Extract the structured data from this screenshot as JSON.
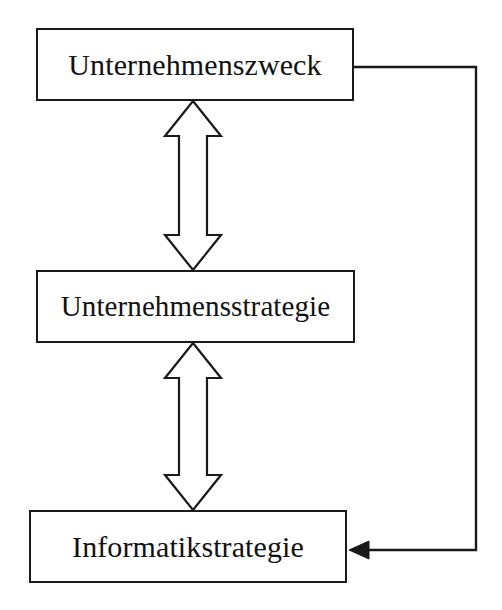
{
  "diagram": {
    "type": "flow-diagram",
    "background_color": "#ffffff",
    "stroke_color": "#1a1a1a",
    "fill_color": "#ffffff",
    "nodes": [
      {
        "id": "unternehmenszweck",
        "label": "Unternehmenszweck",
        "x": 36,
        "y": 28,
        "width": 318,
        "height": 73
      },
      {
        "id": "unternehmensstrategie",
        "label": "Unternehmensstrategie",
        "x": 36,
        "y": 270,
        "width": 319,
        "height": 73
      },
      {
        "id": "informatikstrategie",
        "label": "Informatikstrategie",
        "x": 29,
        "y": 510,
        "width": 318,
        "height": 73
      }
    ],
    "connectors": [
      {
        "id": "arrow-zweck-strategie",
        "kind": "double-headed-block-arrow",
        "orientation": "vertical",
        "from": "unternehmenszweck",
        "to": "unternehmensstrategie",
        "x_center": 193,
        "y_top": 101,
        "y_bottom": 270
      },
      {
        "id": "arrow-strategie-informatik",
        "kind": "double-headed-block-arrow",
        "orientation": "vertical",
        "from": "unternehmensstrategie",
        "to": "informatikstrategie",
        "x_center": 193,
        "y_top": 343,
        "y_bottom": 510
      },
      {
        "id": "feedback-zweck-informatik",
        "kind": "line-arrow",
        "orientation": "orthogonal",
        "from": "unternehmenszweck",
        "to": "informatikstrategie",
        "path": "354,67 476,67 476,550 352,550",
        "arrowhead": "filled-triangle-left"
      }
    ]
  }
}
